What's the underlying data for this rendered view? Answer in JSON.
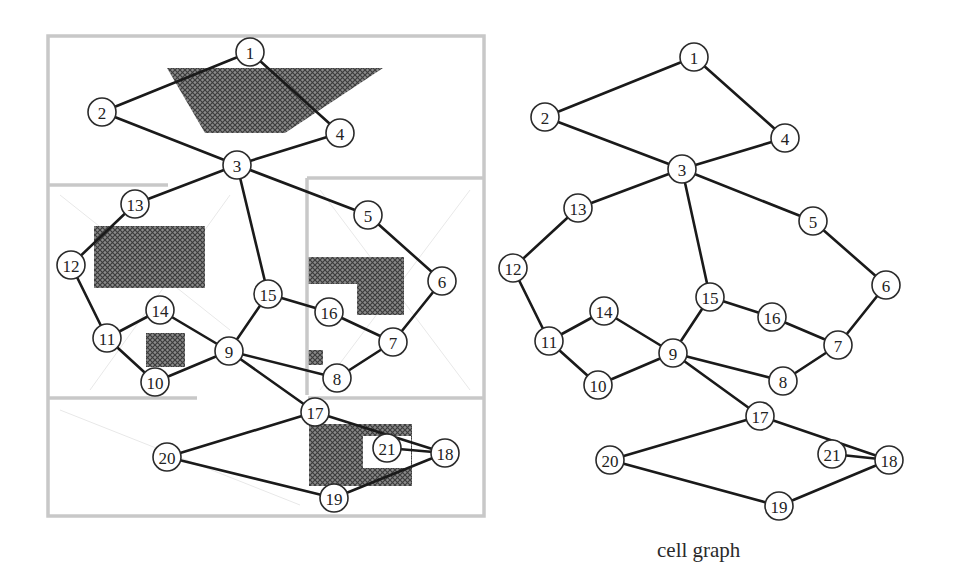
{
  "caption": "cell graph",
  "colors": {
    "edge": "#1a1a1a",
    "node_stroke": "#2a2a2a",
    "obstacle_fill": "#6e6e6e",
    "region_border": "#c8c8c8"
  },
  "edges": [
    [
      1,
      2
    ],
    [
      1,
      4
    ],
    [
      2,
      3
    ],
    [
      4,
      3
    ],
    [
      3,
      13
    ],
    [
      3,
      5
    ],
    [
      3,
      15
    ],
    [
      13,
      12
    ],
    [
      12,
      11
    ],
    [
      11,
      14
    ],
    [
      11,
      10
    ],
    [
      14,
      9
    ],
    [
      10,
      9
    ],
    [
      15,
      9
    ],
    [
      15,
      16
    ],
    [
      16,
      7
    ],
    [
      5,
      6
    ],
    [
      6,
      7
    ],
    [
      7,
      8
    ],
    [
      9,
      8
    ],
    [
      9,
      17
    ],
    [
      17,
      20
    ],
    [
      17,
      18
    ],
    [
      20,
      19
    ],
    [
      19,
      18
    ],
    [
      21,
      18
    ]
  ],
  "left_graph": {
    "label": "decomposition",
    "nodes": [
      {
        "id": "1",
        "x": 250,
        "y": 52
      },
      {
        "id": "2",
        "x": 102,
        "y": 112
      },
      {
        "id": "3",
        "x": 237,
        "y": 165
      },
      {
        "id": "4",
        "x": 340,
        "y": 133
      },
      {
        "id": "5",
        "x": 368,
        "y": 215
      },
      {
        "id": "6",
        "x": 442,
        "y": 281
      },
      {
        "id": "7",
        "x": 393,
        "y": 342
      },
      {
        "id": "8",
        "x": 337,
        "y": 378
      },
      {
        "id": "9",
        "x": 229,
        "y": 351
      },
      {
        "id": "10",
        "x": 155,
        "y": 382
      },
      {
        "id": "11",
        "x": 107,
        "y": 338
      },
      {
        "id": "12",
        "x": 71,
        "y": 265
      },
      {
        "id": "13",
        "x": 135,
        "y": 204
      },
      {
        "id": "14",
        "x": 160,
        "y": 310
      },
      {
        "id": "15",
        "x": 268,
        "y": 294
      },
      {
        "id": "16",
        "x": 329,
        "y": 312
      },
      {
        "id": "17",
        "x": 315,
        "y": 412
      },
      {
        "id": "18",
        "x": 445,
        "y": 453
      },
      {
        "id": "19",
        "x": 334,
        "y": 498
      },
      {
        "id": "20",
        "x": 167,
        "y": 457
      },
      {
        "id": "21",
        "x": 387,
        "y": 448
      }
    ]
  },
  "right_graph": {
    "label": "cell graph",
    "nodes": [
      {
        "id": "1",
        "x": 694,
        "y": 57
      },
      {
        "id": "2",
        "x": 545,
        "y": 117
      },
      {
        "id": "3",
        "x": 682,
        "y": 169
      },
      {
        "id": "4",
        "x": 785,
        "y": 138
      },
      {
        "id": "5",
        "x": 813,
        "y": 221
      },
      {
        "id": "6",
        "x": 886,
        "y": 285
      },
      {
        "id": "7",
        "x": 838,
        "y": 345
      },
      {
        "id": "8",
        "x": 783,
        "y": 381
      },
      {
        "id": "9",
        "x": 673,
        "y": 353
      },
      {
        "id": "10",
        "x": 598,
        "y": 385
      },
      {
        "id": "11",
        "x": 549,
        "y": 341
      },
      {
        "id": "12",
        "x": 513,
        "y": 268
      },
      {
        "id": "13",
        "x": 578,
        "y": 208
      },
      {
        "id": "14",
        "x": 604,
        "y": 311
      },
      {
        "id": "15",
        "x": 710,
        "y": 297
      },
      {
        "id": "16",
        "x": 772,
        "y": 317
      },
      {
        "id": "17",
        "x": 760,
        "y": 416
      },
      {
        "id": "18",
        "x": 889,
        "y": 460
      },
      {
        "id": "19",
        "x": 779,
        "y": 506
      },
      {
        "id": "20",
        "x": 610,
        "y": 460
      },
      {
        "id": "21",
        "x": 832,
        "y": 454
      }
    ]
  },
  "obstacles": [
    {
      "name": "top-quadrilateral",
      "points": "167,68 383,68 285,133 205,133"
    },
    {
      "name": "left-rectangle",
      "points": "94,226 205,226 205,288 94,288"
    },
    {
      "name": "l-shape",
      "points": "307,257 404,257 404,315 357,315 357,284 307,284"
    },
    {
      "name": "small-square",
      "points": "146,333 185,333 185,367 146,367"
    },
    {
      "name": "tiny-square",
      "points": "308,350 323,350 323,365 308,365"
    },
    {
      "name": "bottom-c-shape",
      "points": "309,424 412,424 412,486 309,486 309,424 363,430 363,468 411,468 411,430 363,430"
    }
  ],
  "regions": {
    "outer": {
      "x": 48,
      "y": 36,
      "w": 436,
      "h": 480
    },
    "dividers": [
      {
        "x1": 48,
        "y1": 185,
        "x2": 168,
        "y2": 185
      },
      {
        "x1": 307,
        "y1": 178,
        "x2": 484,
        "y2": 178
      },
      {
        "x1": 307,
        "y1": 178,
        "x2": 307,
        "y2": 395
      },
      {
        "x1": 48,
        "y1": 398,
        "x2": 197,
        "y2": 398
      },
      {
        "x1": 308,
        "y1": 398,
        "x2": 484,
        "y2": 398
      }
    ]
  }
}
